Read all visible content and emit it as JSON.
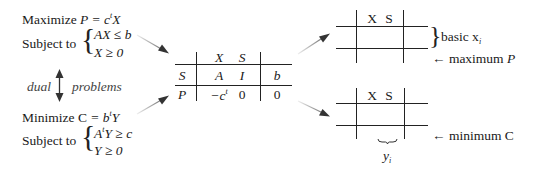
{
  "primal": {
    "objective_prefix": "Maximize ",
    "objective_var": "P",
    "objective_eq": " = c",
    "objective_sup": "t",
    "objective_tail": "X",
    "subject_to": "Subject to",
    "constraint_1": "AX ≤ b",
    "constraint_2": "X ≥ 0"
  },
  "dual_link": {
    "left_label": "dual",
    "right_label": "problems"
  },
  "dual": {
    "objective_prefix": "Minimize ",
    "objective_var": "C",
    "objective_eq": " = b",
    "objective_sup": "t",
    "objective_tail": "Y",
    "subject_to": "Subject to",
    "constraint_1_pre": "A",
    "constraint_1_sup": "t",
    "constraint_1_post": "Y ≥ c",
    "constraint_2": "Y ≥ 0"
  },
  "tableau": {
    "col_headers": [
      "X",
      "S"
    ],
    "rows": [
      {
        "label": "S",
        "cells": [
          "A",
          "I",
          "b"
        ]
      },
      {
        "label": "P",
        "cells": [
          "−c",
          "0",
          "0"
        ],
        "first_sup": "t"
      }
    ]
  },
  "max_result": {
    "col_headers": [
      "X",
      "S"
    ],
    "basic_label": "basic x",
    "basic_sub": "i",
    "bottom_label": "← maximum ",
    "bottom_var": "P"
  },
  "min_result": {
    "col_headers": [
      "X",
      "S"
    ],
    "bottom_label": "← minimum ",
    "bottom_var": "C",
    "under_label": "y",
    "under_sub": "i"
  },
  "colors": {
    "ink": "#1a1a1a",
    "arrow_start": "#e6e6e6",
    "arrow_end": "#333333"
  }
}
